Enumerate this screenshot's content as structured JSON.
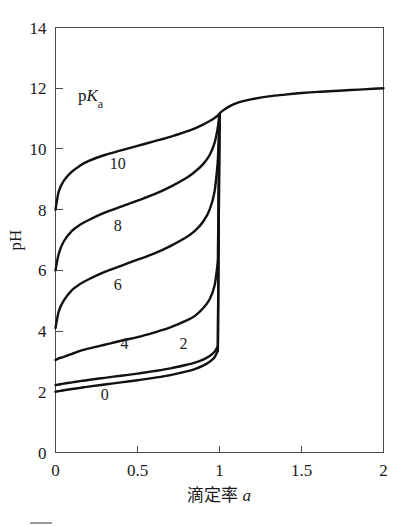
{
  "chart_data": {
    "type": "line",
    "title": "",
    "xlabel": "滴定率 a",
    "ylabel": "pH",
    "xlim": [
      0,
      2
    ],
    "ylim": [
      0,
      14
    ],
    "grid": false,
    "legend_position": "inside-upper-left",
    "legend_title_prefix": "p",
    "legend_title_italic": "K",
    "legend_title_sub": "a",
    "legend_title_plain": "pKa",
    "xticks": [
      {
        "value": 0,
        "label": "0"
      },
      {
        "value": 0.5,
        "label": "0.5"
      },
      {
        "value": 1,
        "label": "1"
      },
      {
        "value": 1.5,
        "label": "1.5"
      },
      {
        "value": 2,
        "label": "2"
      }
    ],
    "yticks": [
      {
        "value": 0,
        "label": "0"
      },
      {
        "value": 2,
        "label": "2"
      },
      {
        "value": 4,
        "label": "4"
      },
      {
        "value": 6,
        "label": "6"
      },
      {
        "value": 8,
        "label": "8"
      },
      {
        "value": 10,
        "label": "10"
      },
      {
        "value": 12,
        "label": "12"
      },
      {
        "value": 14,
        "label": "14"
      }
    ],
    "x": [
      0,
      0.02,
      0.05,
      0.1,
      0.15,
      0.2,
      0.3,
      0.4,
      0.5,
      0.6,
      0.7,
      0.8,
      0.85,
      0.9,
      0.94,
      0.97,
      0.99,
      1.0,
      1.01,
      1.03,
      1.06,
      1.1,
      1.15,
      1.2,
      1.3,
      1.4,
      1.5,
      1.6,
      1.7,
      1.8,
      1.9,
      2.0
    ],
    "series": [
      {
        "name": "10",
        "label": "10",
        "pKa": 10,
        "label_x": 0.38,
        "label_y": 9.35,
        "values": [
          8.0,
          8.6,
          8.95,
          9.25,
          9.45,
          9.6,
          9.8,
          9.95,
          10.1,
          10.25,
          10.4,
          10.58,
          10.68,
          10.8,
          10.92,
          11.02,
          11.1,
          11.15,
          11.22,
          11.3,
          11.4,
          11.5,
          11.58,
          11.64,
          11.73,
          11.79,
          11.84,
          11.88,
          11.91,
          11.94,
          11.97,
          12.0
        ]
      },
      {
        "name": "8",
        "label": "8",
        "pKa": 8,
        "label_x": 0.38,
        "label_y": 7.3,
        "values": [
          6.0,
          6.55,
          6.95,
          7.3,
          7.5,
          7.65,
          7.9,
          8.1,
          8.3,
          8.5,
          8.75,
          9.05,
          9.25,
          9.5,
          9.8,
          10.2,
          10.7,
          11.15,
          11.22,
          11.3,
          11.4,
          11.5,
          11.58,
          11.64,
          11.73,
          11.79,
          11.84,
          11.88,
          11.91,
          11.94,
          11.97,
          12.0
        ]
      },
      {
        "name": "6",
        "label": "6",
        "pKa": 6,
        "label_x": 0.38,
        "label_y": 5.35,
        "values": [
          4.1,
          4.65,
          5.0,
          5.35,
          5.55,
          5.7,
          5.95,
          6.15,
          6.35,
          6.55,
          6.8,
          7.1,
          7.3,
          7.6,
          8.0,
          8.6,
          9.6,
          11.15,
          11.22,
          11.3,
          11.4,
          11.5,
          11.58,
          11.64,
          11.73,
          11.79,
          11.84,
          11.88,
          11.91,
          11.94,
          11.97,
          12.0
        ]
      },
      {
        "name": "4",
        "label": "4",
        "pKa": 4,
        "label_x": 0.42,
        "label_y": 3.42,
        "values": [
          3.05,
          3.1,
          3.15,
          3.25,
          3.35,
          3.42,
          3.55,
          3.68,
          3.8,
          3.95,
          4.12,
          4.35,
          4.5,
          4.75,
          5.05,
          5.5,
          6.3,
          11.15,
          11.22,
          11.3,
          11.4,
          11.5,
          11.58,
          11.64,
          11.73,
          11.79,
          11.84,
          11.88,
          11.91,
          11.94,
          11.97,
          12.0
        ]
      },
      {
        "name": "2",
        "label": "2",
        "pKa": 2,
        "label_x": 0.78,
        "label_y": 3.42,
        "values": [
          2.22,
          2.24,
          2.27,
          2.31,
          2.35,
          2.39,
          2.46,
          2.53,
          2.6,
          2.68,
          2.77,
          2.89,
          2.96,
          3.06,
          3.18,
          3.32,
          3.5,
          11.15,
          11.22,
          11.3,
          11.4,
          11.5,
          11.58,
          11.64,
          11.73,
          11.79,
          11.84,
          11.88,
          11.91,
          11.94,
          11.97,
          12.0
        ]
      },
      {
        "name": "0",
        "label": "0",
        "pKa": 0,
        "label_x": 0.3,
        "label_y": 1.72,
        "values": [
          2.0,
          2.02,
          2.05,
          2.09,
          2.13,
          2.17,
          2.24,
          2.31,
          2.38,
          2.46,
          2.55,
          2.67,
          2.75,
          2.86,
          2.99,
          3.14,
          3.35,
          11.15,
          11.22,
          11.3,
          11.4,
          11.5,
          11.58,
          11.64,
          11.73,
          11.79,
          11.84,
          11.88,
          11.91,
          11.94,
          11.97,
          12.0
        ]
      }
    ]
  },
  "caption": {
    "fragment": ""
  },
  "colors": {
    "curve": "#111111",
    "axis": "#4a4a4a",
    "text": "#1a1a1a",
    "background": "#ffffff"
  }
}
